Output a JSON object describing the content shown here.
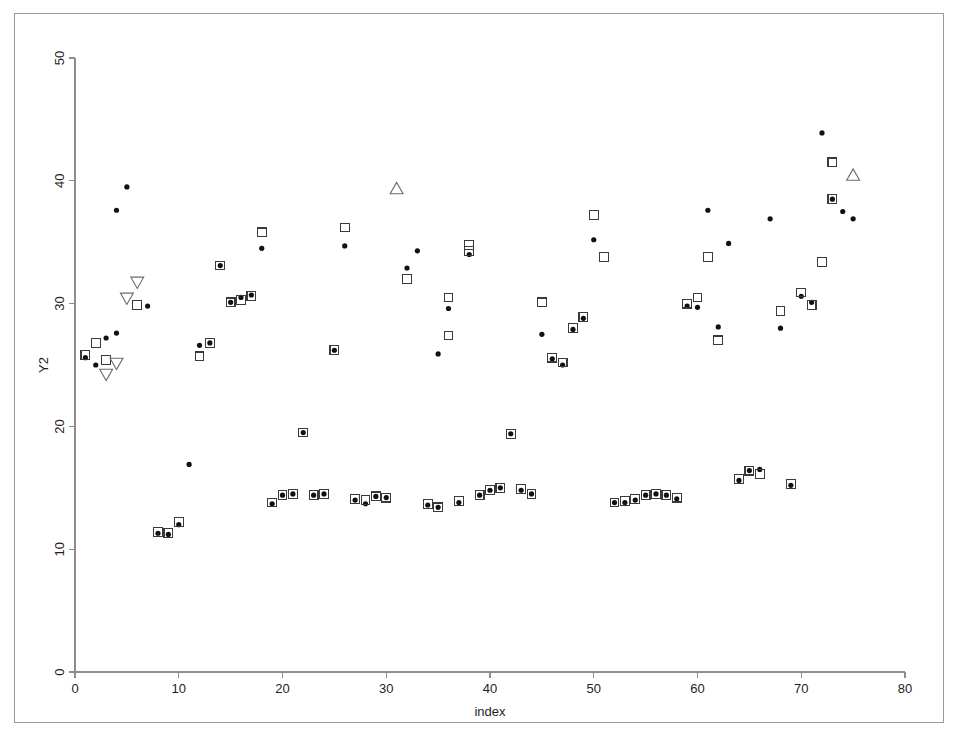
{
  "figure": {
    "background_color": "#ffffff",
    "frame_color": "#9a9a9a",
    "axis_color": "#8d8d8d"
  },
  "chart_data": {
    "type": "scatter",
    "title": "",
    "xlabel": "index",
    "ylabel": "Y2",
    "xlim": [
      0,
      80
    ],
    "ylim": [
      0,
      50
    ],
    "xticks": [
      0,
      10,
      20,
      30,
      40,
      50,
      60,
      70,
      80
    ],
    "yticks": [
      0,
      10,
      20,
      30,
      40,
      50
    ],
    "xtick_labels": [
      "0",
      "10",
      "20",
      "30",
      "40",
      "50",
      "60",
      "70",
      "80"
    ],
    "ytick_labels": [
      "0",
      "10",
      "20",
      "30",
      "40",
      "50"
    ],
    "grid": false,
    "legend": "none",
    "ytick_label_rotation": 90,
    "series": [
      {
        "name": "dot",
        "marker": "filled-circle",
        "color": "#111111",
        "points": [
          [
            1,
            25.6
          ],
          [
            2,
            25.0
          ],
          [
            3,
            27.2
          ],
          [
            4,
            27.6
          ],
          [
            5,
            39.5
          ],
          [
            4,
            37.6
          ],
          [
            7,
            29.8
          ],
          [
            8,
            11.3
          ],
          [
            9,
            11.2
          ],
          [
            10,
            12.0
          ],
          [
            11,
            16.9
          ],
          [
            12,
            26.6
          ],
          [
            13,
            26.8
          ],
          [
            14,
            33.1
          ],
          [
            15,
            30.1
          ],
          [
            16,
            30.5
          ],
          [
            17,
            30.7
          ],
          [
            18,
            34.5
          ],
          [
            19,
            13.7
          ],
          [
            20,
            14.4
          ],
          [
            21,
            14.5
          ],
          [
            22,
            19.5
          ],
          [
            23,
            14.4
          ],
          [
            24,
            14.5
          ],
          [
            25,
            26.2
          ],
          [
            26,
            34.7
          ],
          [
            27,
            14.0
          ],
          [
            28,
            13.7
          ],
          [
            29,
            14.3
          ],
          [
            30,
            14.2
          ],
          [
            32,
            32.9
          ],
          [
            33,
            34.3
          ],
          [
            34,
            13.6
          ],
          [
            35,
            13.4
          ],
          [
            36,
            29.6
          ],
          [
            35,
            25.9
          ],
          [
            37,
            13.8
          ],
          [
            38,
            34.0
          ],
          [
            39,
            14.4
          ],
          [
            40,
            14.8
          ],
          [
            41,
            15.0
          ],
          [
            42,
            19.4
          ],
          [
            43,
            14.8
          ],
          [
            44,
            14.5
          ],
          [
            45,
            27.5
          ],
          [
            46,
            25.5
          ],
          [
            47,
            25.0
          ],
          [
            48,
            27.9
          ],
          [
            49,
            28.8
          ],
          [
            50,
            35.2
          ],
          [
            52,
            13.8
          ],
          [
            53,
            13.8
          ],
          [
            54,
            14.0
          ],
          [
            55,
            14.4
          ],
          [
            56,
            14.5
          ],
          [
            57,
            14.4
          ],
          [
            58,
            14.1
          ],
          [
            59,
            29.8
          ],
          [
            60,
            29.7
          ],
          [
            61,
            37.6
          ],
          [
            62,
            28.1
          ],
          [
            63,
            34.9
          ],
          [
            64,
            15.6
          ],
          [
            65,
            16.4
          ],
          [
            66,
            16.5
          ],
          [
            67,
            36.9
          ],
          [
            68,
            28.0
          ],
          [
            69,
            15.2
          ],
          [
            70,
            30.6
          ],
          [
            71,
            30.1
          ],
          [
            72,
            43.9
          ],
          [
            73,
            38.5
          ],
          [
            74,
            37.5
          ],
          [
            75,
            36.9
          ]
        ]
      },
      {
        "name": "square",
        "marker": "open-square",
        "color": "#3a3a3a",
        "points": [
          [
            1,
            25.8
          ],
          [
            2,
            26.8
          ],
          [
            3,
            25.4
          ],
          [
            6,
            29.9
          ],
          [
            8,
            11.4
          ],
          [
            9,
            11.3
          ],
          [
            10,
            12.2
          ],
          [
            12,
            25.7
          ],
          [
            13,
            26.8
          ],
          [
            14,
            33.1
          ],
          [
            15,
            30.1
          ],
          [
            16,
            30.3
          ],
          [
            17,
            30.6
          ],
          [
            18,
            35.8
          ],
          [
            19,
            13.8
          ],
          [
            20,
            14.4
          ],
          [
            21,
            14.5
          ],
          [
            22,
            19.5
          ],
          [
            23,
            14.4
          ],
          [
            24,
            14.5
          ],
          [
            25,
            26.2
          ],
          [
            26,
            36.2
          ],
          [
            27,
            14.1
          ],
          [
            28,
            14.0
          ],
          [
            29,
            14.3
          ],
          [
            30,
            14.2
          ],
          [
            32,
            32.0
          ],
          [
            34,
            13.7
          ],
          [
            35,
            13.4
          ],
          [
            36,
            27.4
          ],
          [
            36,
            30.5
          ],
          [
            37,
            13.9
          ],
          [
            38,
            34.3
          ],
          [
            38,
            34.8
          ],
          [
            39,
            14.4
          ],
          [
            40,
            14.8
          ],
          [
            41,
            15.0
          ],
          [
            42,
            19.4
          ],
          [
            43,
            14.9
          ],
          [
            44,
            14.5
          ],
          [
            45,
            30.1
          ],
          [
            46,
            25.6
          ],
          [
            47,
            25.2
          ],
          [
            48,
            28.0
          ],
          [
            49,
            28.9
          ],
          [
            50,
            37.2
          ],
          [
            51,
            33.8
          ],
          [
            52,
            13.8
          ],
          [
            53,
            13.9
          ],
          [
            54,
            14.1
          ],
          [
            55,
            14.4
          ],
          [
            56,
            14.5
          ],
          [
            57,
            14.4
          ],
          [
            58,
            14.2
          ],
          [
            59,
            30.0
          ],
          [
            60,
            30.5
          ],
          [
            61,
            33.8
          ],
          [
            62,
            27.0
          ],
          [
            64,
            15.7
          ],
          [
            65,
            16.4
          ],
          [
            66,
            16.1
          ],
          [
            68,
            29.4
          ],
          [
            69,
            15.3
          ],
          [
            70,
            30.9
          ],
          [
            71,
            29.9
          ],
          [
            72,
            33.4
          ],
          [
            73,
            41.5
          ],
          [
            73,
            38.5
          ]
        ]
      },
      {
        "name": "triangle-down",
        "marker": "open-triangle-down",
        "color": "#6b6b6b",
        "points": [
          [
            3,
            24.3
          ],
          [
            4,
            25.2
          ],
          [
            5,
            30.5
          ],
          [
            6,
            31.8
          ]
        ]
      },
      {
        "name": "triangle-up",
        "marker": "open-triangle-up",
        "color": "#6b6b6b",
        "points": [
          [
            31,
            39.3
          ],
          [
            75,
            40.4
          ]
        ]
      }
    ]
  }
}
